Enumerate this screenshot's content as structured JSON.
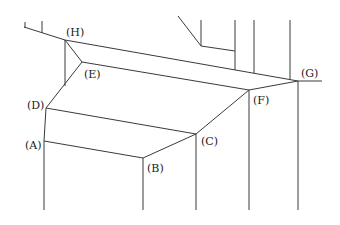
{
  "diagram": {
    "type": "line-drawing-3d-ledge",
    "stroke_color": "#3a3a3a",
    "label_color": "#1a1a1a",
    "vertices": {
      "H": {
        "x": 65,
        "y": 40,
        "label": "(H)",
        "lx": 52,
        "ly": 36
      },
      "E": {
        "x": 82,
        "y": 62,
        "label": "(E)",
        "lx": 84,
        "ly": 78
      },
      "D": {
        "x": 46,
        "y": 108,
        "label": "(D)",
        "lx": 26,
        "ly": 108
      },
      "A": {
        "x": 44,
        "y": 141,
        "label": "(A)",
        "lx": 24,
        "ly": 148
      },
      "B": {
        "x": 143,
        "y": 158,
        "label": "(B)",
        "lx": 147,
        "ly": 172
      },
      "C": {
        "x": 196,
        "y": 134,
        "label": "(C)",
        "lx": 201,
        "ly": 144
      },
      "F": {
        "x": 249,
        "y": 90,
        "label": "(F)",
        "lx": 253,
        "ly": 104
      },
      "G": {
        "x": 298,
        "y": 81,
        "label": "(G)",
        "lx": 301,
        "ly": 76
      }
    },
    "labels": [
      "(A)",
      "(B)",
      "(C)",
      "(D)",
      "(E)",
      "(F)",
      "(G)",
      "(H)"
    ]
  }
}
